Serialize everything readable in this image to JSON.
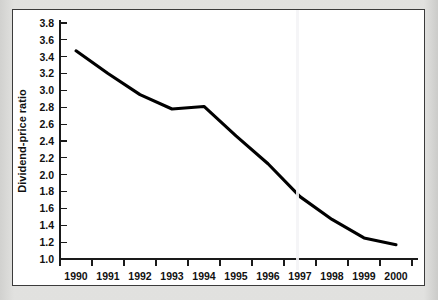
{
  "chart_data": {
    "type": "line",
    "title": "",
    "xlabel": "",
    "ylabel": "Dividend-price ratio",
    "x": [
      1990,
      1991,
      1992,
      1993,
      1994,
      1995,
      1996,
      1997,
      1998,
      1999,
      2000
    ],
    "values": [
      3.47,
      3.2,
      2.95,
      2.78,
      2.81,
      2.46,
      2.13,
      1.74,
      1.47,
      1.25,
      1.17
    ],
    "series": [
      {
        "name": "Dividend-price ratio",
        "values": [
          3.47,
          3.2,
          2.95,
          2.78,
          2.81,
          2.46,
          2.13,
          1.74,
          1.47,
          1.25,
          1.17
        ]
      }
    ],
    "xtick_labels": [
      "1990",
      "1991",
      "1992",
      "1993",
      "1994",
      "1995",
      "1996",
      "1997",
      "1998",
      "1999",
      "2000"
    ],
    "ytick_labels": [
      "3.8",
      "3.6",
      "3.4",
      "3.2",
      "3.0",
      "2.8",
      "2.6",
      "2.4",
      "2.2",
      "2.0",
      "1.8",
      "1.6",
      "1.4",
      "1.2",
      "1.0"
    ],
    "ytick_values": [
      3.8,
      3.6,
      3.4,
      3.2,
      3.0,
      2.8,
      2.6,
      2.4,
      2.2,
      2.0,
      1.8,
      1.6,
      1.4,
      1.2,
      1.0
    ],
    "ylim": [
      1.0,
      3.8
    ],
    "xlim": [
      1990,
      2000
    ],
    "grid": false,
    "legend": false,
    "legend_position": "none",
    "line_color": "#000000",
    "background_color": "#ffffff",
    "page_color": "#dcdcda",
    "annotations": []
  }
}
